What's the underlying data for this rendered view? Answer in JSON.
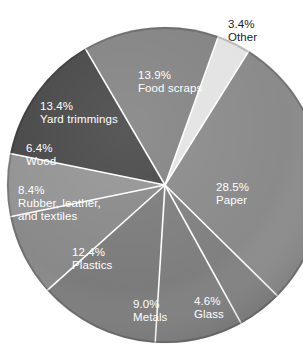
{
  "chart_data": {
    "type": "pie",
    "title": "",
    "subtitle": "",
    "xlabel": "",
    "ylabel": "",
    "legend_position": "none",
    "grid": false,
    "units": "percent",
    "categories": [
      "Paper",
      "Glass",
      "Metals",
      "Plastics",
      "Rubber, leather, and textiles",
      "Wood",
      "Yard trimmings",
      "Food scraps",
      "Other"
    ],
    "values": [
      28.5,
      4.6,
      9.0,
      12.4,
      8.4,
      6.4,
      13.4,
      13.9,
      3.4
    ],
    "value_labels": [
      "28.5%",
      "4.6%",
      "9.0%",
      "12.4%",
      "8.4%",
      "6.4%",
      "13.4%",
      "13.9%",
      "3.4%"
    ],
    "colors": [
      "#8a8a8a",
      "#808080",
      "#7e7e7e",
      "#7b7b7b",
      "#898989",
      "#939393",
      "#474747",
      "#838383",
      "#e3e3e3"
    ],
    "slices": [
      {
        "name": "paper",
        "label": "Paper",
        "percent_label": "28.5%",
        "value": 28.5,
        "color": "#8a8a8a",
        "label_color": "#ffffff",
        "label_placement": "inside",
        "label_left": 216,
        "label_top": 181
      },
      {
        "name": "glass",
        "label": "Glass",
        "percent_label": "4.6%",
        "value": 4.6,
        "color": "#808080",
        "label_color": "#ffffff",
        "label_placement": "inside",
        "label_left": 194,
        "label_top": 295
      },
      {
        "name": "metals",
        "label": "Metals",
        "percent_label": "9.0%",
        "value": 9.0,
        "color": "#7e7e7e",
        "label_color": "#ffffff",
        "label_placement": "inside",
        "label_left": 133,
        "label_top": 298
      },
      {
        "name": "plastics",
        "label": "Plastics",
        "percent_label": "12.4%",
        "value": 12.4,
        "color": "#7b7b7b",
        "label_color": "#ffffff",
        "label_placement": "inside",
        "label_left": 72,
        "label_top": 246
      },
      {
        "name": "rubber-leather-textiles",
        "label": "Rubber, leather,",
        "label_line2": "and textiles",
        "percent_label": "8.4%",
        "value": 8.4,
        "color": "#898989",
        "label_color": "#ffffff",
        "label_placement": "inside",
        "label_left": 18,
        "label_top": 184
      },
      {
        "name": "wood",
        "label": "Wood",
        "percent_label": "6.4%",
        "value": 6.4,
        "color": "#939393",
        "label_color": "#ffffff",
        "label_placement": "inside",
        "label_left": 26,
        "label_top": 142
      },
      {
        "name": "yard-trimmings",
        "label": "Yard trimmings",
        "percent_label": "13.4%",
        "value": 13.4,
        "color": "#474747",
        "label_color": "#ffffff",
        "label_placement": "inside",
        "label_left": 40,
        "label_top": 100
      },
      {
        "name": "food-scraps",
        "label": "Food scraps",
        "percent_label": "13.9%",
        "value": 13.9,
        "color": "#838383",
        "label_color": "#ffffff",
        "label_placement": "inside",
        "label_left": 138,
        "label_top": 69
      },
      {
        "name": "other",
        "label": "Other",
        "percent_label": "3.4%",
        "value": 3.4,
        "color": "#e3e3e3",
        "label_color": "#1d1d1d",
        "label_placement": "outside",
        "label_left": 228,
        "label_top": 18
      }
    ],
    "geometry": {
      "center_x": 165,
      "center_y": 185,
      "radius": 158,
      "start_angle_deg": -58,
      "direction": "clockwise",
      "separator_color": "#ffffff",
      "separator_width": 1.6
    }
  }
}
